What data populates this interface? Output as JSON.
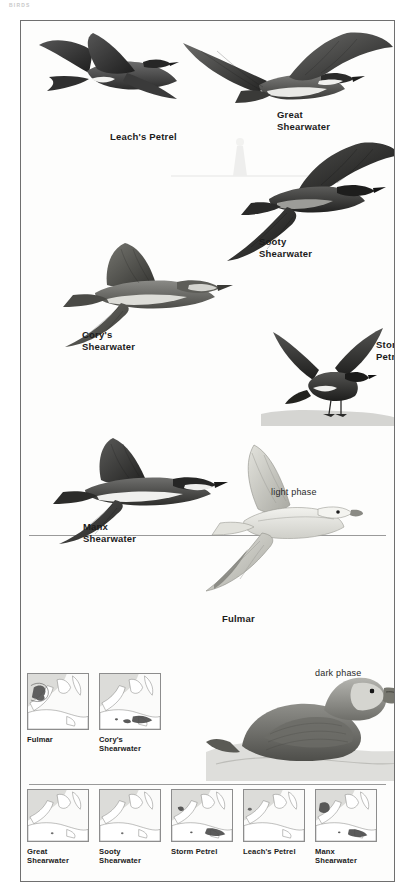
{
  "page": {
    "header": "BIRDS",
    "width": 415,
    "height": 895,
    "background": "#ffffff",
    "frame_color": "#6f6f6f",
    "plate_background": "#fdfdfc"
  },
  "plate": {
    "title": "Seabirds: Shearwaters, Petrels and Fulmar",
    "labels": [
      {
        "id": "leachs-petrel",
        "text": "Leach's Petrel",
        "x": 89,
        "y": 110,
        "bold": true
      },
      {
        "id": "great-shearwater",
        "text": "Great\nShearwater",
        "x": 256,
        "y": 88,
        "bold": true
      },
      {
        "id": "sooty-shearwater",
        "text": "Sooty\nShearwater",
        "x": 238,
        "y": 215,
        "bold": true
      },
      {
        "id": "corys-shearwater",
        "text": "Cory's\nShearwater",
        "x": 61,
        "y": 308,
        "bold": true
      },
      {
        "id": "storm-petrel",
        "text": "Storm\nPetrel",
        "x": 355,
        "y": 318,
        "bold": true
      },
      {
        "id": "manx-shearwater",
        "text": "Manx\nShearwater",
        "x": 62,
        "y": 500,
        "bold": true
      },
      {
        "id": "light-phase",
        "text": "light phase",
        "x": 250,
        "y": 466,
        "bold": false
      },
      {
        "id": "fulmar",
        "text": "Fulmar",
        "x": 201,
        "y": 592,
        "bold": true
      },
      {
        "id": "dark-phase",
        "text": "dark phase",
        "x": 294,
        "y": 647,
        "bold": false
      }
    ],
    "birds": [
      {
        "id": "leachs-petrel",
        "common_name": "Leach's Petrel",
        "plumage": null
      },
      {
        "id": "great-shearwater",
        "common_name": "Great Shearwater",
        "plumage": null
      },
      {
        "id": "sooty-shearwater",
        "common_name": "Sooty Shearwater",
        "plumage": null
      },
      {
        "id": "corys-shearwater",
        "common_name": "Cory's Shearwater",
        "plumage": null
      },
      {
        "id": "storm-petrel",
        "common_name": "Storm Petrel",
        "plumage": null
      },
      {
        "id": "manx-shearwater",
        "common_name": "Manx Shearwater",
        "plumage": null
      },
      {
        "id": "fulmar-light",
        "common_name": "Fulmar",
        "plumage": "light phase"
      },
      {
        "id": "fulmar-dark",
        "common_name": "Fulmar",
        "plumage": "dark phase"
      }
    ]
  },
  "maps": {
    "row1": [
      {
        "id": "map-fulmar",
        "caption": "Fulmar"
      },
      {
        "id": "map-corys-shearwater",
        "caption": "Cory's\nShearwater"
      }
    ],
    "row2": [
      {
        "id": "map-great-shearwater",
        "caption": "Great\nShearwater"
      },
      {
        "id": "map-sooty-shearwater",
        "caption": "Sooty\nShearwater"
      },
      {
        "id": "map-storm-petrel",
        "caption": "Storm Petrel"
      },
      {
        "id": "map-leachs-petrel",
        "caption": "Leach's Petrel"
      },
      {
        "id": "map-manx-shearwater",
        "caption": "Manx\nShearwater"
      }
    ],
    "sea_color": "#d8d8d6",
    "land_color": "#ffffff",
    "range_color": "#4a4a4a",
    "border_color": "#8d8d8d"
  }
}
